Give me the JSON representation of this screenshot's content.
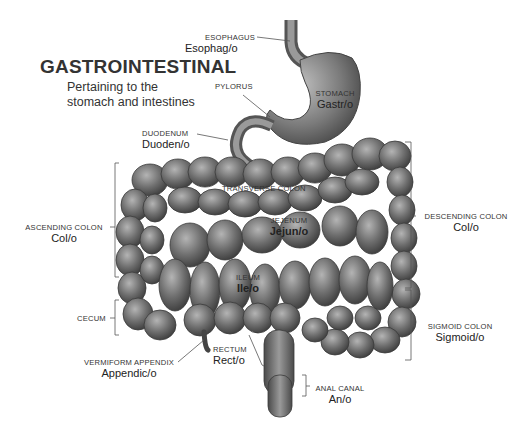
{
  "header": {
    "title": "GASTROINTESTINAL",
    "subtitle_line1": "Pertaining to the",
    "subtitle_line2": "stomach and intestines"
  },
  "labels": {
    "esophagus": {
      "name": "ESOPHAGUS",
      "term": "Esophag/o"
    },
    "pylorus": {
      "name": "PYLORUS"
    },
    "stomach": {
      "name": "STOMACH",
      "term": "Gastr/o"
    },
    "duodenum": {
      "name": "DUODENUM",
      "term": "Duoden/o"
    },
    "transverse_colon": {
      "name": "TRANSVERSE COLON"
    },
    "jejunum": {
      "name": "JEJENUM",
      "term": "Jejun/o"
    },
    "ileum": {
      "name": "ILEUM",
      "term": "Ile/o"
    },
    "ascending_colon": {
      "name": "ASCENDING COLON",
      "term": "Col/o"
    },
    "descending_colon": {
      "name": "DESCENDING COLON",
      "term": "Col/o"
    },
    "cecum": {
      "name": "CECUM"
    },
    "sigmoid_colon": {
      "name": "SIGMOID COLON",
      "term": "Sigmoid/o"
    },
    "vermiform_appendix": {
      "name": "VERMIFORM APPENDIX",
      "term": "Appendic/o"
    },
    "rectum": {
      "name": "RECTUM",
      "term": "Rect/o"
    },
    "anal_canal": {
      "name": "ANAL CANAL",
      "term": "An/o"
    }
  },
  "colors": {
    "background": "#ffffff",
    "organ_dark": "#3c3c3c",
    "organ_mid": "#6e6e6e",
    "organ_light": "#a8a8a8",
    "text": "#2a2a2a",
    "line": "#555555"
  }
}
